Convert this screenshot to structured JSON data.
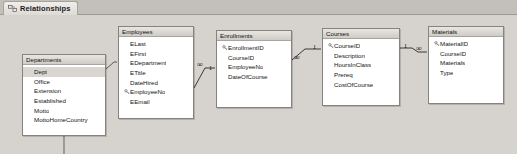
{
  "window": {
    "tab": {
      "label": "Relationships",
      "icon": "relationships-icon"
    },
    "background_color": "#d6d3ce",
    "canvas_color": "#d6d3ce"
  },
  "tables": [
    {
      "id": "departments",
      "title": "Departments",
      "fields": [
        {
          "name": "Dept",
          "key": false,
          "selected": true
        },
        {
          "name": "Office",
          "key": false,
          "selected": false
        },
        {
          "name": "Extension",
          "key": false,
          "selected": false
        },
        {
          "name": "Established",
          "key": false,
          "selected": false
        },
        {
          "name": "Motto",
          "key": false,
          "selected": false
        },
        {
          "name": "MottoHomeCountry",
          "key": false,
          "selected": false
        }
      ]
    },
    {
      "id": "employees",
      "title": "Employees",
      "fields": [
        {
          "name": "ELast",
          "key": false,
          "selected": false
        },
        {
          "name": "EFirst",
          "key": false,
          "selected": false
        },
        {
          "name": "EDepartment",
          "key": false,
          "selected": false
        },
        {
          "name": "ETitle",
          "key": false,
          "selected": false
        },
        {
          "name": "DateHired",
          "key": false,
          "selected": false
        },
        {
          "name": "EmployeeNo",
          "key": true,
          "selected": false
        },
        {
          "name": "EEmail",
          "key": false,
          "selected": false
        }
      ]
    },
    {
      "id": "enrollments",
      "title": "Enrollments",
      "fields": [
        {
          "name": "EnrollmentID",
          "key": true,
          "selected": false
        },
        {
          "name": "CourseID",
          "key": false,
          "selected": false
        },
        {
          "name": "EmployeeNo",
          "key": false,
          "selected": false
        },
        {
          "name": "DateOfCourse",
          "key": false,
          "selected": false
        }
      ]
    },
    {
      "id": "courses",
      "title": "Courses",
      "fields": [
        {
          "name": "CourseID",
          "key": true,
          "selected": false
        },
        {
          "name": "Description",
          "key": false,
          "selected": false
        },
        {
          "name": "HoursInClass",
          "key": false,
          "selected": false
        },
        {
          "name": "Prereq",
          "key": false,
          "selected": false
        },
        {
          "name": "CostOfCourse",
          "key": false,
          "selected": false
        }
      ]
    },
    {
      "id": "materials",
      "title": "Materials",
      "fields": [
        {
          "name": "MaterialID",
          "key": true,
          "selected": false
        },
        {
          "name": "CourseID",
          "key": false,
          "selected": false
        },
        {
          "name": "Materials",
          "key": false,
          "selected": false
        },
        {
          "name": "Type",
          "key": false,
          "selected": false
        }
      ]
    }
  ],
  "relationships": [
    {
      "id": "employees-enrollments",
      "from_table": "employees",
      "to_table": "enrollments",
      "from_cardinality": "1",
      "to_cardinality": "∞"
    },
    {
      "id": "enrollments-courses",
      "from_table": "enrollments",
      "to_table": "courses",
      "from_cardinality": "∞",
      "to_cardinality": "1"
    },
    {
      "id": "courses-materials",
      "from_table": "courses",
      "to_table": "materials",
      "from_cardinality": "1",
      "to_cardinality": "∞"
    },
    {
      "id": "departments-employees",
      "from_table": "departments",
      "to_table": "employees",
      "from_cardinality": "",
      "to_cardinality": ""
    }
  ],
  "markers": {
    "m1": "1",
    "m2": "∞",
    "m3": "∞",
    "m4": "1",
    "m5": "1",
    "m6": "∞"
  }
}
